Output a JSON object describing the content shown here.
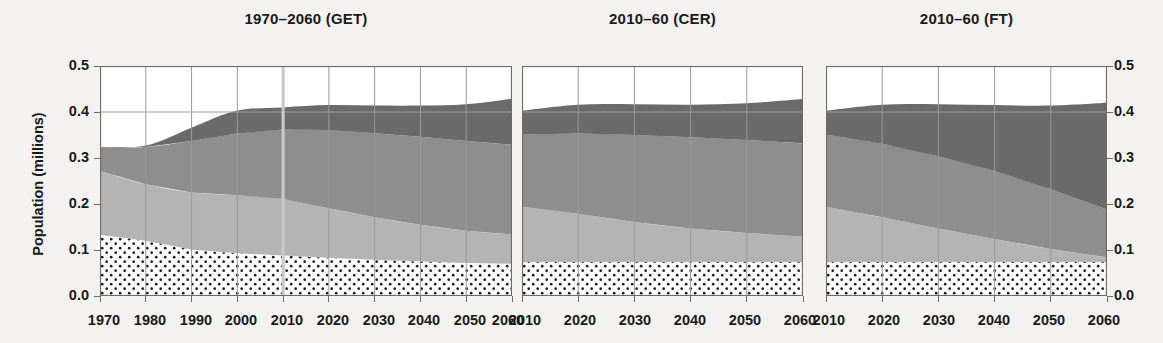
{
  "figure": {
    "ylabel": "Population (millions)",
    "y_ticks": [
      "0.0",
      "0.1",
      "0.2",
      "0.3",
      "0.4",
      "0.5"
    ],
    "ylim": [
      0.0,
      0.5
    ],
    "background_color": "#f3f2f0",
    "plot_background_color": "#ffffff"
  },
  "series_colors": {
    "band1_dotted": "#ffffff",
    "band2_light_gray": "#b4b4b4",
    "band3_medium_gray": "#8e8e8e",
    "band4_dark_gray": "#6a6a6a",
    "gridline": "#9a9a9a",
    "axis": "#6b6b6b",
    "highlight_line": "#c9c9c9"
  },
  "chart_data": [
    {
      "type": "area",
      "title": "1970–2060 (GET)",
      "xlabel": "",
      "ylabel": "Population (millions)",
      "ylim": [
        0.0,
        0.5
      ],
      "xlim": [
        1970,
        2060
      ],
      "grid": true,
      "legend": "none",
      "x": [
        1970,
        1980,
        1990,
        2000,
        2010,
        2020,
        2030,
        2040,
        2050,
        2060
      ],
      "x_ticks": [
        "1970",
        "1980",
        "1990",
        "2000",
        "2010",
        "2020",
        "2030",
        "2040",
        "2050",
        "2060"
      ],
      "annotations": [
        {
          "type": "vline",
          "x": 2010,
          "label": "2010 divider"
        }
      ],
      "series": [
        {
          "name": "band1_dotted",
          "values": [
            0.133,
            0.12,
            0.101,
            0.093,
            0.088,
            0.083,
            0.079,
            0.075,
            0.072,
            0.07
          ]
        },
        {
          "name": "band2_light_gray",
          "values": [
            0.139,
            0.123,
            0.124,
            0.126,
            0.123,
            0.108,
            0.092,
            0.08,
            0.07,
            0.064
          ]
        },
        {
          "name": "band3_medium_gray",
          "values": [
            0.052,
            0.081,
            0.112,
            0.134,
            0.151,
            0.17,
            0.183,
            0.191,
            0.195,
            0.195
          ]
        },
        {
          "name": "band4_dark_gray",
          "values": [
            0.0,
            0.003,
            0.029,
            0.05,
            0.048,
            0.054,
            0.06,
            0.068,
            0.08,
            0.1
          ]
        }
      ],
      "stacked_totals": [
        0.324,
        0.327,
        0.366,
        0.403,
        0.41,
        0.415,
        0.414,
        0.414,
        0.417,
        0.429
      ]
    },
    {
      "type": "area",
      "title": "2010–60 (CER)",
      "xlabel": "",
      "ylabel": "",
      "ylim": [
        0.0,
        0.5
      ],
      "xlim": [
        2010,
        2060
      ],
      "grid": true,
      "legend": "none",
      "x": [
        2010,
        2020,
        2030,
        2040,
        2050,
        2060
      ],
      "x_ticks": [
        "2010",
        "2020",
        "2030",
        "2040",
        "2050",
        "2060"
      ],
      "annotations": [],
      "series": [
        {
          "name": "band1_dotted",
          "values": [
            0.074,
            0.074,
            0.074,
            0.074,
            0.074,
            0.074
          ]
        },
        {
          "name": "band2_light_gray",
          "values": [
            0.12,
            0.105,
            0.087,
            0.073,
            0.063,
            0.055
          ]
        },
        {
          "name": "band3_medium_gray",
          "values": [
            0.157,
            0.174,
            0.189,
            0.198,
            0.202,
            0.203
          ]
        },
        {
          "name": "band4_dark_gray",
          "values": [
            0.052,
            0.063,
            0.067,
            0.071,
            0.08,
            0.096
          ]
        }
      ],
      "stacked_totals": [
        0.403,
        0.416,
        0.417,
        0.416,
        0.419,
        0.428
      ]
    },
    {
      "type": "area",
      "title": "2010–60 (FT)",
      "xlabel": "",
      "ylabel": "",
      "ylim": [
        0.0,
        0.5
      ],
      "xlim": [
        2010,
        2060
      ],
      "grid": true,
      "legend": "none",
      "x": [
        2010,
        2020,
        2030,
        2040,
        2050,
        2060
      ],
      "x_ticks": [
        "2010",
        "2020",
        "2030",
        "2040",
        "2050",
        "2060"
      ],
      "annotations": [],
      "series": [
        {
          "name": "band1_dotted",
          "values": [
            0.074,
            0.074,
            0.074,
            0.074,
            0.074,
            0.074
          ]
        },
        {
          "name": "band2_light_gray",
          "values": [
            0.12,
            0.097,
            0.073,
            0.05,
            0.028,
            0.01
          ]
        },
        {
          "name": "band3_medium_gray",
          "values": [
            0.157,
            0.16,
            0.157,
            0.148,
            0.13,
            0.104
          ]
        },
        {
          "name": "band4_dark_gray",
          "values": [
            0.052,
            0.085,
            0.113,
            0.143,
            0.182,
            0.232
          ]
        }
      ],
      "stacked_totals": [
        0.403,
        0.416,
        0.417,
        0.415,
        0.414,
        0.42
      ]
    }
  ],
  "panels_geometry": [
    {
      "left": 100,
      "width": 412,
      "x_tick_positions": [
        104,
        150,
        196,
        241,
        287,
        333,
        379,
        424,
        470,
        508
      ]
    },
    {
      "left": 522,
      "width": 281,
      "x_tick_positions": [
        525,
        580,
        635,
        690,
        745,
        800
      ]
    },
    {
      "left": 826,
      "width": 281,
      "x_tick_positions": [
        829,
        884,
        939,
        994,
        1049,
        1104
      ]
    }
  ]
}
